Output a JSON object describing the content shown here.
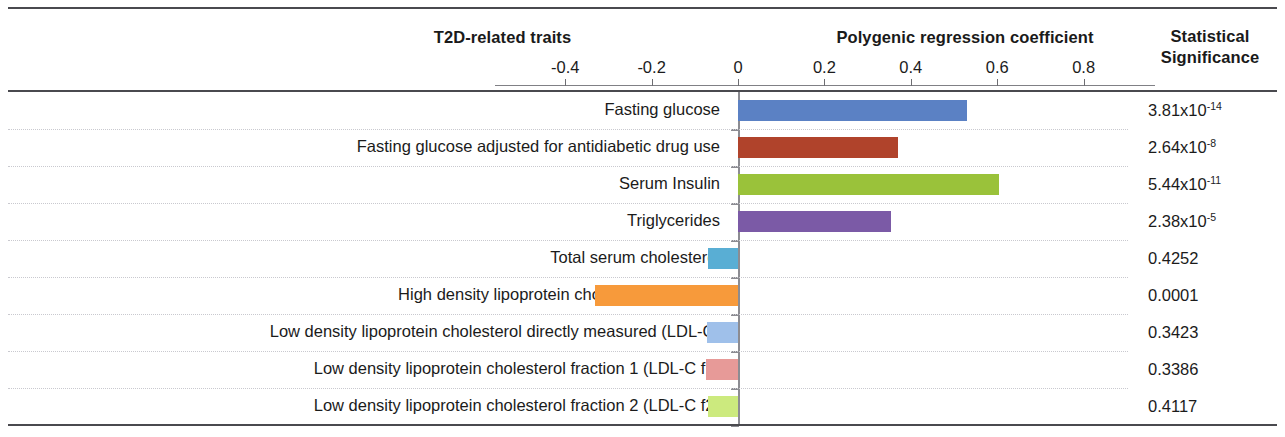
{
  "header": {
    "traits_label": "T2D-related traits",
    "coefficient_label": "Polygenic regression coefficient",
    "significance_label_line1": "Statistical",
    "significance_label_line2": "Significance"
  },
  "axis": {
    "ticks": [
      "-0.4",
      "-0.2",
      "0",
      "0.2",
      "0.4",
      "0.6",
      "0.8"
    ],
    "tick_values": [
      -0.4,
      -0.2,
      0,
      0.2,
      0.4,
      0.6,
      0.8
    ],
    "min": -0.5,
    "max": 0.9
  },
  "rows": [
    {
      "label": "Fasting glucose",
      "value": 0.53,
      "color": "#5b81c4",
      "significance": "3.81x10",
      "significance_exponent": "-14"
    },
    {
      "label": "Fasting glucose adjusted for antidiabetic drug use",
      "value": 0.37,
      "color": "#b0432b",
      "significance": "2.64x10",
      "significance_exponent": "-8"
    },
    {
      "label": "Serum Insulin",
      "value": 0.605,
      "color": "#9ac23a",
      "significance": "5.44x10",
      "significance_exponent": "-11"
    },
    {
      "label": "Triglycerides",
      "value": 0.355,
      "color": "#7b5aa6",
      "significance": "2.38x10",
      "significance_exponent": "-5"
    },
    {
      "label": "Total serum cholesterol",
      "value": -0.07,
      "color": "#59aed4",
      "significance": "0.4252",
      "significance_exponent": ""
    },
    {
      "label": "High density lipoprotein cholesterol (HDL-C)",
      "value": -0.33,
      "color": "#f79a3b",
      "significance": "0.0001",
      "significance_exponent": ""
    },
    {
      "label": "Low density lipoprotein cholesterol directly measured (LDL-C)",
      "value": -0.072,
      "color": "#9fc0ea",
      "significance": "0.3423",
      "significance_exponent": ""
    },
    {
      "label": "Low density lipoprotein cholesterol fraction 1 (LDL-C f1)",
      "value": -0.074,
      "color": "#e79a98",
      "significance": "0.3386",
      "significance_exponent": ""
    },
    {
      "label": "Low density lipoprotein cholesterol fraction 2 (LDL-C f2)",
      "value": -0.07,
      "color": "#ccea7e",
      "significance": "0.4117",
      "significance_exponent": ""
    }
  ],
  "chart_data": {
    "type": "bar",
    "title": "Polygenic regression coefficient",
    "xlabel": "Polygenic regression coefficient",
    "ylabel": "T2D-related traits",
    "orientation": "horizontal",
    "grid": true,
    "legend": "none",
    "xlim": [
      -0.5,
      0.9
    ],
    "xticks": [
      -0.4,
      -0.2,
      0,
      0.2,
      0.4,
      0.6,
      0.8
    ],
    "categories": [
      "Fasting glucose",
      "Fasting glucose adjusted for antidiabetic drug use",
      "Serum Insulin",
      "Triglycerides",
      "Total serum cholesterol",
      "High density lipoprotein cholesterol (HDL-C)",
      "Low density lipoprotein cholesterol directly measured (LDL-C)",
      "Low density lipoprotein cholesterol fraction 1 (LDL-C f1)",
      "Low density lipoprotein cholesterol fraction 2 (LDL-C f2)"
    ],
    "values": [
      0.53,
      0.37,
      0.605,
      0.355,
      -0.07,
      -0.33,
      -0.072,
      -0.074,
      -0.07
    ],
    "annotations": {
      "statistical_significance": [
        "3.81x10-14",
        "2.64x10-8",
        "5.44x10-11",
        "2.38x10-5",
        "0.4252",
        "0.0001",
        "0.3423",
        "0.3386",
        "0.4117"
      ]
    },
    "colors": [
      "#5b81c4",
      "#b0432b",
      "#9ac23a",
      "#7b5aa6",
      "#59aed4",
      "#f79a3b",
      "#9fc0ea",
      "#e79a98",
      "#ccea7e"
    ]
  }
}
